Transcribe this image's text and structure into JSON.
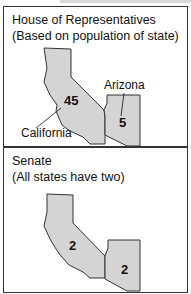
{
  "house": {
    "title_line1": "House of Representatives",
    "title_line2": "(Based on population of state)",
    "california": {
      "label": "California",
      "value": "45"
    },
    "arizona": {
      "label": "Arizona",
      "value": "5"
    }
  },
  "senate": {
    "title_line1": "Senate",
    "title_line2": "(All states have two)",
    "california": {
      "value": "2"
    },
    "arizona": {
      "value": "2"
    }
  },
  "colors": {
    "state_fill": "#d4d4d4",
    "border": "#333333"
  }
}
